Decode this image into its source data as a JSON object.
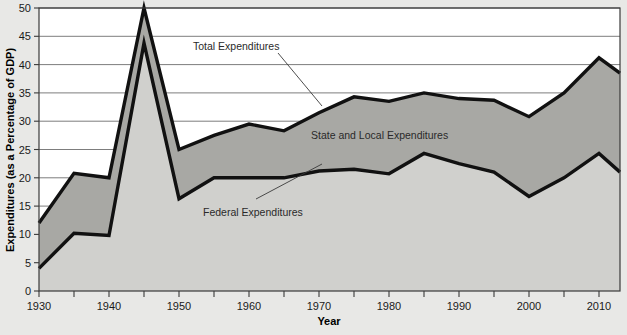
{
  "chart_data": {
    "type": "area",
    "title": "",
    "subtitle": "",
    "xlabel": "Year",
    "ylabel": "Expenditures (as a Percentage of GDP)",
    "xlim": [
      1930,
      2013
    ],
    "ylim": [
      0,
      50
    ],
    "grid": true,
    "legend_position": "inline-annotations",
    "x": [
      1930,
      1935,
      1940,
      1945,
      1950,
      1955,
      1960,
      1965,
      1970,
      1975,
      1980,
      1985,
      1990,
      1995,
      2000,
      2005,
      2010,
      2013
    ],
    "xticks": [
      1930,
      1935,
      1940,
      1945,
      1950,
      1955,
      1960,
      1965,
      1970,
      1975,
      1980,
      1985,
      1990,
      1995,
      2000,
      2005,
      2010
    ],
    "xtick_labels": [
      "1930",
      "",
      "1940",
      "",
      "1950",
      "",
      "1960",
      "",
      "1970",
      "",
      "1980",
      "",
      "1990",
      "",
      "2000",
      "",
      "2010"
    ],
    "yticks": [
      0,
      5,
      10,
      15,
      20,
      25,
      30,
      35,
      40,
      45,
      50
    ],
    "ytick_labels": [
      "0",
      "5",
      "10",
      "15",
      "20",
      "25",
      "30",
      "35",
      "40",
      "45",
      "50"
    ],
    "series": [
      {
        "name": "Total Expenditures",
        "values": [
          12.0,
          20.8,
          20.0,
          50.0,
          25.0,
          27.5,
          29.5,
          28.3,
          31.5,
          34.3,
          33.5,
          35.0,
          34.0,
          33.7,
          30.8,
          35.0,
          41.2,
          38.5
        ]
      },
      {
        "name": "Federal Expenditures",
        "values": [
          4.0,
          10.2,
          9.8,
          43.8,
          16.3,
          20.0,
          20.0,
          20.0,
          21.2,
          21.5,
          20.7,
          24.3,
          22.5,
          21.0,
          16.7,
          20.0,
          24.3,
          21.0
        ]
      }
    ],
    "bands": [
      {
        "name": "State and Local Expenditures",
        "description": "Area between Federal Expenditures and Total Expenditures"
      }
    ],
    "annotations": [
      {
        "text": "Total Expenditures",
        "kind": "callout-label"
      },
      {
        "text": "State and Local Expenditures",
        "kind": "band-label"
      },
      {
        "text": "Federal Expenditures",
        "kind": "callout-label"
      }
    ],
    "colors": {
      "background": "#e8e8e6",
      "plot_background": "#ffffff",
      "federal_fill": "#d0d0cd",
      "state_local_fill": "#a8a8a4",
      "line": "#111111",
      "gridline": "#6e6e6e",
      "axis": "#3a3a3a",
      "text": "#1a1a1a"
    }
  }
}
